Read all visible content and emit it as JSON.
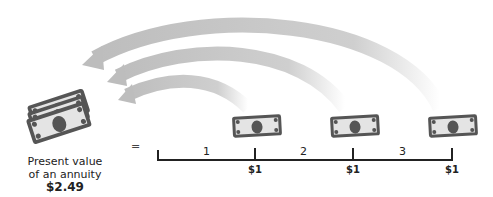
{
  "present_value": {
    "line1": "Present value",
    "line2": "of an annuity",
    "amount": "$2.49"
  },
  "equals_sign": "=",
  "timeline": {
    "periods": [
      "1",
      "2",
      "3"
    ],
    "payments": [
      "$1",
      "$1",
      "$1"
    ]
  },
  "colors": {
    "arrow": "#c8c8c8",
    "bill_fill": "#e6e6e6",
    "bill_dark": "#555555",
    "line": "#222222"
  }
}
